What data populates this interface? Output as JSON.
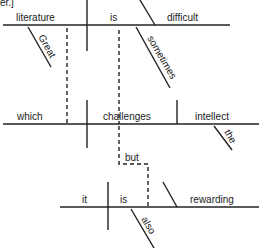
{
  "corner_fragment": "er.]",
  "words": {
    "literature": "literature",
    "is1": "is",
    "difficult": "difficult",
    "great": "Great",
    "sometimes": "sometimes",
    "which": "which",
    "challenges": "challenges",
    "intellect": "intellect",
    "the": "the",
    "but": "but",
    "it": "it",
    "is2": "is",
    "rewarding": "rewarding",
    "also": "also"
  }
}
